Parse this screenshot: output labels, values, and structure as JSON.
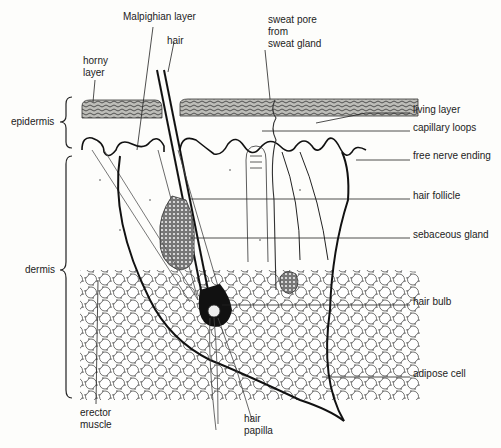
{
  "diagram": {
    "colors": {
      "ink": "#1a1a1a",
      "background": "#fdfdfb",
      "horny_layer_fill": "#6b6b6b",
      "gland_fill": "#4a4a4a",
      "bleed_through_text": "#d9d9d4"
    },
    "brackets": [
      {
        "id": "epidermis",
        "label": "epidermis"
      },
      {
        "id": "dermis",
        "label": "dermis"
      }
    ],
    "labels": {
      "malpighian_layer": "Malpighian layer",
      "hair": "hair",
      "horny_layer": "horny\nlayer",
      "sweat_pore": "sweat pore\nfrom\nsweat gland",
      "living_layer": "living layer",
      "capillary_loops": "capillary loops",
      "free_nerve_ending": "free nerve ending",
      "hair_follicle": "hair follicle",
      "sebaceous_gland": "sebaceous gland",
      "hair_bulb": "hair bulb",
      "adipose_cell": "adipose cell",
      "erector_muscle": "erector\nmuscle",
      "hair_papilla": "hair\npapilla"
    }
  }
}
